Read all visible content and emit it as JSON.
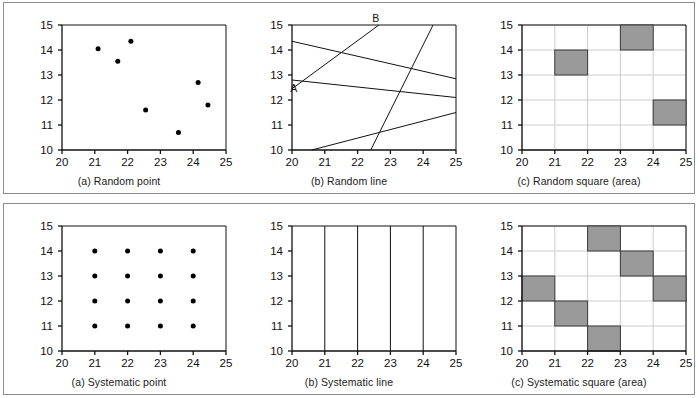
{
  "figure": {
    "rows": [
      {
        "name": "random-sampling-row",
        "panels": [
          {
            "id": "random-point",
            "caption": "(a) Random point",
            "type": "scatter"
          },
          {
            "id": "random-line",
            "caption": "(b) Random line",
            "type": "line"
          },
          {
            "id": "random-square",
            "caption": "(c) Random square (area)",
            "type": "square"
          }
        ]
      },
      {
        "name": "systematic-sampling-row",
        "panels": [
          {
            "id": "systematic-point",
            "caption": "(a) Systematic point",
            "type": "scatter"
          },
          {
            "id": "systematic-line",
            "caption": "(b) Systematic line",
            "type": "line"
          },
          {
            "id": "systematic-square",
            "caption": "(c) Systematic square (area)",
            "type": "square"
          }
        ]
      }
    ]
  },
  "axes": {
    "x_ticks": [
      20,
      21,
      22,
      23,
      24,
      25
    ],
    "y_ticks": [
      10,
      11,
      12,
      13,
      14,
      15
    ],
    "xlim": [
      20,
      25
    ],
    "ylim": [
      10,
      15
    ]
  },
  "colors": {
    "axis": "#111111",
    "grid": "#cccccc",
    "square_fill": "#9a9a9a",
    "square_stroke": "#3a3a3a",
    "point": "#000000",
    "frame": "#8d8d8d",
    "background": "#ffffff"
  },
  "chart_data": [
    {
      "type": "scatter",
      "title": "(a) Random point",
      "xlabel": "",
      "ylabel": "",
      "xlim": [
        20,
        25
      ],
      "ylim": [
        10,
        15
      ],
      "grid": false,
      "legend": "none",
      "points": [
        {
          "x": 21.1,
          "y": 14.05
        },
        {
          "x": 21.7,
          "y": 13.55
        },
        {
          "x": 22.1,
          "y": 14.35
        },
        {
          "x": 22.55,
          "y": 11.6
        },
        {
          "x": 23.55,
          "y": 10.7
        },
        {
          "x": 24.15,
          "y": 12.7
        },
        {
          "x": 24.45,
          "y": 11.8
        }
      ]
    },
    {
      "type": "line",
      "title": "(b) Random line",
      "xlabel": "",
      "ylabel": "",
      "xlim": [
        20,
        25
      ],
      "ylim": [
        10,
        15
      ],
      "grid": false,
      "legend": "none",
      "annotations": [
        {
          "text": "A",
          "x": 20.05,
          "y": 12.45
        },
        {
          "text": "B",
          "x": 22.55,
          "y": 15.25
        }
      ],
      "lines": [
        {
          "name": "line-AB",
          "x1": 20.0,
          "y1": 12.45,
          "x2": 22.65,
          "y2": 15.0
        },
        {
          "name": "line-2",
          "x1": 20.0,
          "y1": 14.35,
          "x2": 25.0,
          "y2": 12.85
        },
        {
          "name": "line-3",
          "x1": 20.0,
          "y1": 12.8,
          "x2": 25.0,
          "y2": 12.1
        },
        {
          "name": "line-4",
          "x1": 20.6,
          "y1": 10.0,
          "x2": 25.0,
          "y2": 11.5
        },
        {
          "name": "line-5",
          "x1": 22.4,
          "y1": 10.0,
          "x2": 24.3,
          "y2": 15.0
        }
      ]
    },
    {
      "type": "square",
      "title": "(c) Random square (area)",
      "xlabel": "",
      "ylabel": "",
      "xlim": [
        20,
        25
      ],
      "ylim": [
        10,
        15
      ],
      "grid": true,
      "legend": "none",
      "squares": [
        {
          "x": 21,
          "y": 13,
          "w": 1,
          "h": 1
        },
        {
          "x": 23,
          "y": 14,
          "w": 1,
          "h": 1
        },
        {
          "x": 24,
          "y": 11,
          "w": 1,
          "h": 1
        }
      ]
    },
    {
      "type": "scatter",
      "title": "(a) Systematic point",
      "xlabel": "",
      "ylabel": "",
      "xlim": [
        20,
        25
      ],
      "ylim": [
        10,
        15
      ],
      "grid": false,
      "legend": "none",
      "points": [
        {
          "x": 21,
          "y": 11
        },
        {
          "x": 22,
          "y": 11
        },
        {
          "x": 23,
          "y": 11
        },
        {
          "x": 24,
          "y": 11
        },
        {
          "x": 21,
          "y": 12
        },
        {
          "x": 22,
          "y": 12
        },
        {
          "x": 23,
          "y": 12
        },
        {
          "x": 24,
          "y": 12
        },
        {
          "x": 21,
          "y": 13
        },
        {
          "x": 22,
          "y": 13
        },
        {
          "x": 23,
          "y": 13
        },
        {
          "x": 24,
          "y": 13
        },
        {
          "x": 21,
          "y": 14
        },
        {
          "x": 22,
          "y": 14
        },
        {
          "x": 23,
          "y": 14
        },
        {
          "x": 24,
          "y": 14
        }
      ]
    },
    {
      "type": "line",
      "title": "(b) Systematic line",
      "xlabel": "",
      "ylabel": "",
      "xlim": [
        20,
        25
      ],
      "ylim": [
        10,
        15
      ],
      "grid": false,
      "legend": "none",
      "lines": [
        {
          "name": "vline-21",
          "x1": 21,
          "y1": 10,
          "x2": 21,
          "y2": 15
        },
        {
          "name": "vline-22",
          "x1": 22,
          "y1": 10,
          "x2": 22,
          "y2": 15
        },
        {
          "name": "vline-23",
          "x1": 23,
          "y1": 10,
          "x2": 23,
          "y2": 15
        },
        {
          "name": "vline-24",
          "x1": 24,
          "y1": 10,
          "x2": 24,
          "y2": 15
        }
      ]
    },
    {
      "type": "square",
      "title": "(c) Systematic square (area)",
      "xlabel": "",
      "ylabel": "",
      "xlim": [
        20,
        25
      ],
      "ylim": [
        10,
        15
      ],
      "grid": true,
      "legend": "none",
      "squares": [
        {
          "x": 20,
          "y": 12,
          "w": 1,
          "h": 1
        },
        {
          "x": 21,
          "y": 11,
          "w": 1,
          "h": 1
        },
        {
          "x": 22,
          "y": 10,
          "w": 1,
          "h": 1
        },
        {
          "x": 22,
          "y": 14,
          "w": 1,
          "h": 1
        },
        {
          "x": 23,
          "y": 13,
          "w": 1,
          "h": 1
        },
        {
          "x": 24,
          "y": 12,
          "w": 1,
          "h": 1
        }
      ]
    }
  ]
}
